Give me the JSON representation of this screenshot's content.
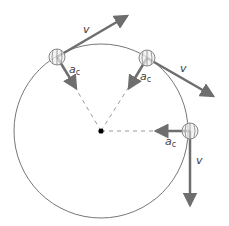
{
  "diagram": {
    "colors": {
      "background": "#ffffff",
      "circle": "#777777",
      "arrow": "#6e6e6e",
      "dashed": "#999999",
      "ball_fill": "#eeeeee",
      "center": "#000000",
      "text": "#444444"
    },
    "circle": {
      "cx": 101,
      "cy": 131,
      "r": 87
    },
    "center_point": {
      "cx": 101,
      "cy": 131,
      "r": 3
    },
    "positions": [
      {
        "name": "top-left",
        "ball": {
          "cx": 57,
          "cy": 57,
          "r": 8
        },
        "velocity": {
          "label": "v",
          "x1": 57,
          "y1": 57,
          "x2": 127,
          "y2": 16,
          "label_x": 83,
          "label_y": 32
        },
        "acceleration": {
          "label": "a",
          "sub": "c",
          "x1": 57,
          "y1": 57,
          "x2": 77,
          "y2": 90,
          "label_x": 70,
          "label_y": 71
        }
      },
      {
        "name": "top-right",
        "ball": {
          "cx": 147,
          "cy": 58,
          "r": 8
        },
        "velocity": {
          "label": "v",
          "x1": 147,
          "y1": 58,
          "x2": 215,
          "y2": 97,
          "label_x": 180,
          "label_y": 71
        },
        "acceleration": {
          "label": "a",
          "sub": "c",
          "x1": 147,
          "y1": 58,
          "x2": 128,
          "y2": 90,
          "label_x": 140,
          "label_y": 80
        }
      },
      {
        "name": "right",
        "ball": {
          "cx": 190,
          "cy": 131,
          "r": 8
        },
        "velocity": {
          "label": "v",
          "x1": 190,
          "y1": 131,
          "x2": 190,
          "y2": 207,
          "label_x": 196,
          "label_y": 163
        },
        "acceleration": {
          "label": "a",
          "sub": "c",
          "x1": 190,
          "y1": 131,
          "x2": 154,
          "y2": 131,
          "label_x": 166,
          "label_y": 145
        }
      }
    ]
  }
}
